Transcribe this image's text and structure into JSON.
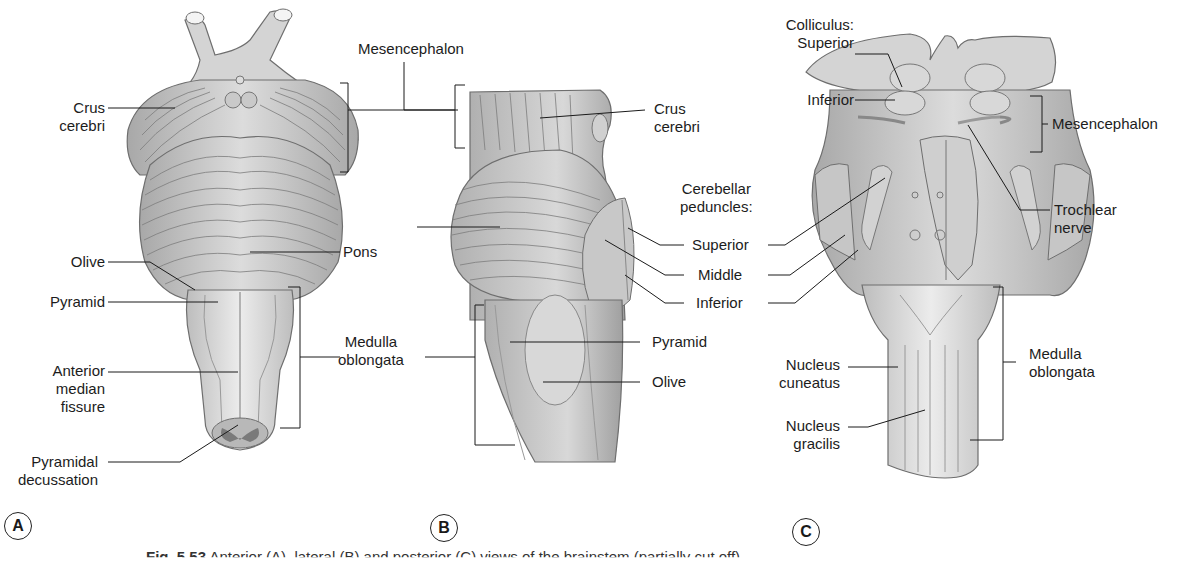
{
  "figure": {
    "caption_number": "Fig. 5.53",
    "caption_text": "Anterior (A), lateral (B) and posterior (C) views of the brainstem (partially cut off)",
    "panels": [
      "A",
      "B",
      "C"
    ]
  },
  "panel_a": {
    "view": "anterior",
    "labels": {
      "crus_cerebri_1": "Crus",
      "crus_cerebri_2": "cerebri",
      "mesencephalon": "Mesencephalon",
      "pons": "Pons",
      "olive": "Olive",
      "pyramid": "Pyramid",
      "anterior_median_fissure_1": "Anterior",
      "anterior_median_fissure_2": "median",
      "anterior_median_fissure_3": "fissure",
      "pyramidal_decussation_1": "Pyramidal",
      "pyramidal_decussation_2": "decussation",
      "medulla_oblongata_1": "Medulla",
      "medulla_oblongata_2": "oblongata"
    }
  },
  "panel_b": {
    "view": "lateral",
    "labels": {
      "crus_cerebri_1": "Crus",
      "crus_cerebri_2": "cerebri",
      "cerebellar_peduncles_1": "Cerebellar",
      "cerebellar_peduncles_2": "peduncles:",
      "superior": "Superior",
      "middle": "Middle",
      "inferior": "Inferior",
      "pyramid": "Pyramid",
      "olive": "Olive"
    }
  },
  "panel_c": {
    "view": "posterior",
    "labels": {
      "colliculus": "Colliculus:",
      "superior": "Superior",
      "inferior": "Inferior",
      "mesencephalon": "Mesencephalon",
      "trochlear_nerve_1": "Trochlear",
      "trochlear_nerve_2": "nerve",
      "nucleus_cuneatus_1": "Nucleus",
      "nucleus_cuneatus_2": "cuneatus",
      "nucleus_gracilis_1": "Nucleus",
      "nucleus_gracilis_2": "gracilis",
      "medulla_oblongata_1": "Medulla",
      "medulla_oblongata_2": "oblongata"
    }
  },
  "colors": {
    "tissue_light": "#e2e2e2",
    "tissue_mid": "#c4c4c4",
    "tissue_dark": "#9a9a9a",
    "outline": "#6e6e6e",
    "leader_line": "#1a1a1a",
    "decussation": "#7a7a7a"
  }
}
